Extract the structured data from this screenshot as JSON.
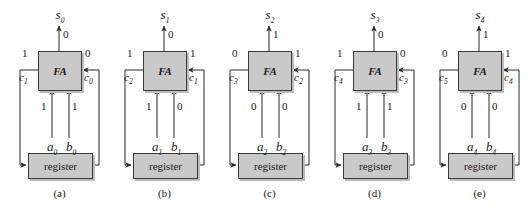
{
  "figure": {
    "type": "serial-adder-cell-sequence",
    "block_label": "FA",
    "register_label": "register",
    "cells": [
      {
        "caption": "(a)",
        "sum_name": "s",
        "sum_index": "0",
        "sum_value": "0",
        "carry_out_name": "c",
        "carry_out_index": "1",
        "carry_out_value": "1",
        "carry_in_name": "c",
        "carry_in_index": "0",
        "carry_in_value": "0",
        "a_name": "a",
        "a_index": "0",
        "a_value": "1",
        "b_name": "b",
        "b_index": "0",
        "b_value": "1"
      },
      {
        "caption": "(b)",
        "sum_name": "s",
        "sum_index": "1",
        "sum_value": "0",
        "carry_out_name": "c",
        "carry_out_index": "2",
        "carry_out_value": "1",
        "carry_in_name": "c",
        "carry_in_index": "1",
        "carry_in_value": "1",
        "a_name": "a",
        "a_index": "1",
        "a_value": "1",
        "b_name": "b",
        "b_index": "1",
        "b_value": "0"
      },
      {
        "caption": "(c)",
        "sum_name": "s",
        "sum_index": "2",
        "sum_value": "1",
        "carry_out_name": "c",
        "carry_out_index": "3",
        "carry_out_value": "0",
        "carry_in_name": "c",
        "carry_in_index": "2",
        "carry_in_value": "1",
        "a_name": "a",
        "a_index": "2",
        "a_value": "0",
        "b_name": "b",
        "b_index": "2",
        "b_value": "0"
      },
      {
        "caption": "(d)",
        "sum_name": "s",
        "sum_index": "3",
        "sum_value": "0",
        "carry_out_name": "c",
        "carry_out_index": "4",
        "carry_out_value": "1",
        "carry_in_name": "c",
        "carry_in_index": "3",
        "carry_in_value": "0",
        "a_name": "a",
        "a_index": "3",
        "a_value": "1",
        "b_name": "b",
        "b_index": "3",
        "b_value": "1"
      },
      {
        "caption": "(e)",
        "sum_name": "s",
        "sum_index": "4",
        "sum_value": "1",
        "carry_out_name": "c",
        "carry_out_index": "5",
        "carry_out_value": "0",
        "carry_in_name": "c",
        "carry_in_index": "4",
        "carry_in_value": "1",
        "a_name": "a",
        "a_index": "4",
        "a_value": "0",
        "b_name": "b",
        "b_index": "4",
        "b_value": "0"
      }
    ],
    "colors": {
      "box_fill": "#c9c9c9",
      "box_stroke": "#3a3a3a",
      "wire": "#2b2b2b",
      "background": "#ffffff"
    }
  }
}
